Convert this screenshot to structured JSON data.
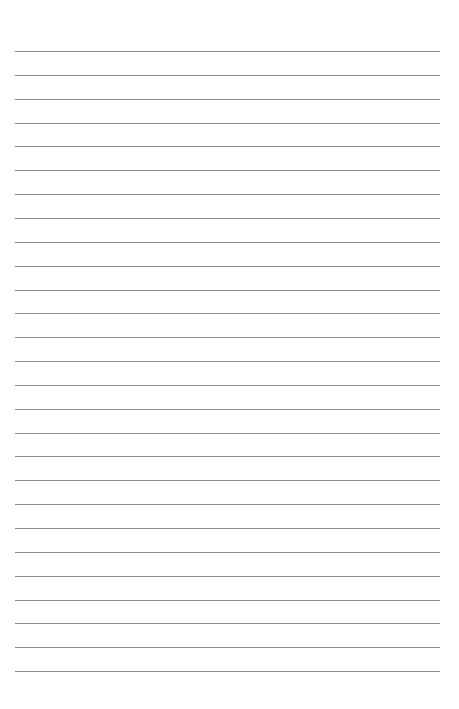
{
  "page": {
    "type": "lined-paper",
    "background_color": "#ffffff",
    "line_color": "#8c8c8c",
    "line_count": 27,
    "line_left": 15,
    "line_right": 440,
    "first_line_y": 51,
    "line_spacing": 23.85
  }
}
